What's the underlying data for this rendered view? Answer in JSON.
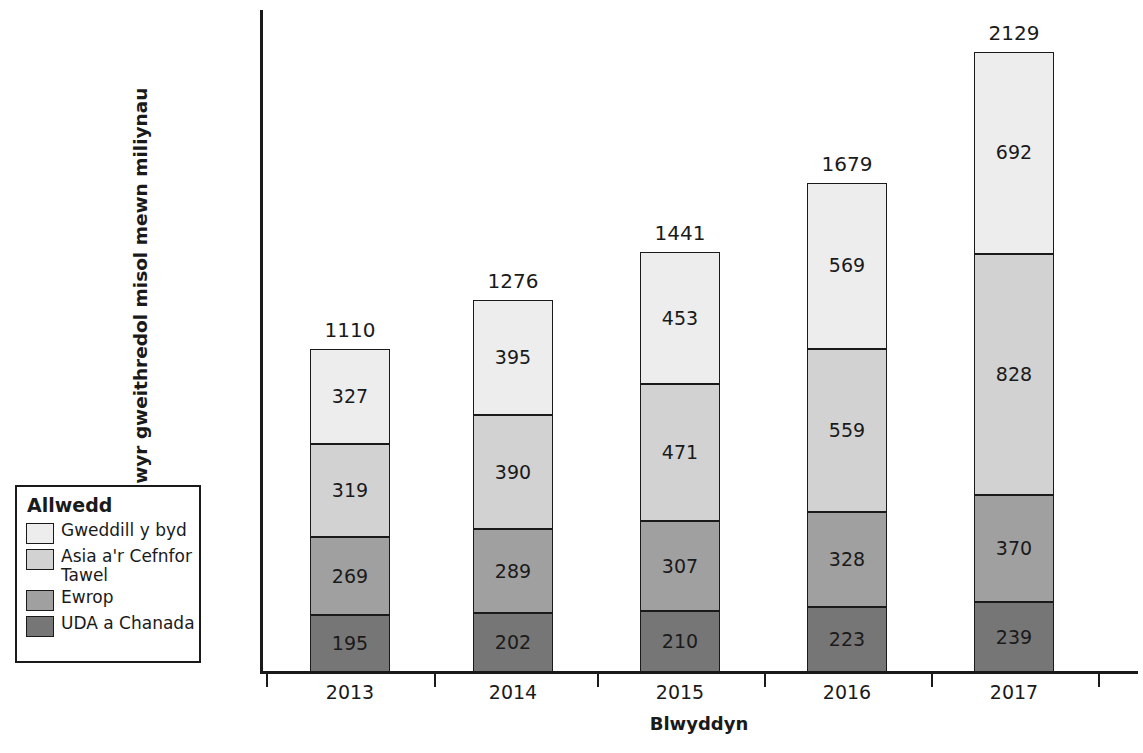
{
  "chart_data": {
    "type": "bar",
    "subtype": "stacked-vertical",
    "title": "",
    "xlabel": "Blwyddyn",
    "ylabel": "Defnyddwyr gweithredol misol mewn miliynau",
    "categories": [
      "2013",
      "2014",
      "2015",
      "2016",
      "2017"
    ],
    "series": [
      {
        "name": "UDA a Chanada",
        "color": "#767676",
        "values": [
          195,
          202,
          210,
          223,
          239
        ]
      },
      {
        "name": "Ewrop",
        "color": "#a0a0a0",
        "values": [
          269,
          289,
          307,
          328,
          370
        ]
      },
      {
        "name": "Asia a'r Cefnfor Tawel",
        "color": "#d2d2d2",
        "values": [
          319,
          390,
          471,
          559,
          828
        ]
      },
      {
        "name": "Gweddill y byd",
        "color": "#ededed",
        "values": [
          327,
          395,
          453,
          569,
          692
        ]
      }
    ],
    "totals": [
      1110,
      1276,
      1441,
      1679,
      2129
    ],
    "ylim": [
      0,
      2129
    ],
    "grid": false,
    "legend_position": "left",
    "axis_ticks_visible": true,
    "value_labels_shown": true
  },
  "legend": {
    "title": "Allwedd",
    "entries": [
      {
        "label": "Gweddill y byd",
        "color": "#ededed"
      },
      {
        "label": "Asia a'r Cefnfor Tawel",
        "color": "#d2d2d2"
      },
      {
        "label": "Ewrop",
        "color": "#a0a0a0"
      },
      {
        "label": "UDA a Chanada",
        "color": "#767676"
      }
    ]
  },
  "axes": {
    "x_title": "Blwyddyn",
    "y_title": "Defnyddwyr gweithredol misol mewn miliynau"
  }
}
